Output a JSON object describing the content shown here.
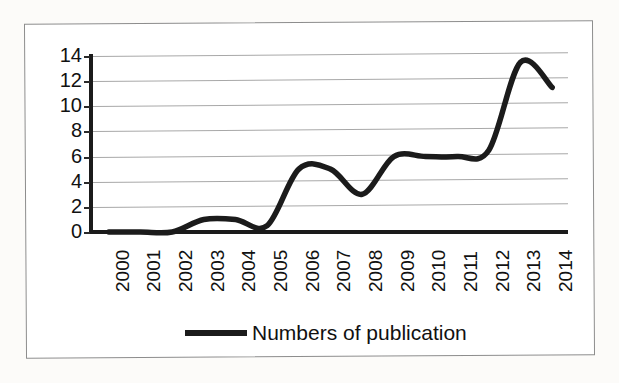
{
  "chart_data": {
    "type": "line",
    "title": "",
    "xlabel": "",
    "ylabel": "",
    "categories": [
      "2000",
      "2001",
      "2002",
      "2003",
      "2004",
      "2005",
      "2006",
      "2007",
      "2008",
      "2009",
      "2010",
      "2011",
      "2012",
      "2013",
      "2014"
    ],
    "series": [
      {
        "name": "Numbers of publication",
        "color": "#1b1b1b",
        "values": [
          0,
          0,
          0,
          1,
          1,
          0.5,
          5,
          5,
          3,
          6,
          6,
          6,
          6.5,
          13.5,
          11.5
        ]
      }
    ],
    "values": [
      0,
      0,
      0,
      1,
      1,
      0.5,
      5,
      5,
      3,
      6,
      6,
      6,
      6.5,
      13.5,
      11.5
    ],
    "ylim": [
      0,
      14
    ],
    "ytick_values": [
      14,
      12,
      10,
      8,
      6,
      4,
      2,
      0
    ],
    "ytick_labels": [
      "14",
      "12",
      "10",
      "8",
      "6",
      "4",
      "2",
      "0"
    ],
    "grid": true,
    "legend_position": "bottom-center",
    "smoothing": "spline"
  },
  "legend": {
    "entries": [
      {
        "label": "Numbers of publication",
        "color": "#1b1b1b"
      }
    ]
  },
  "artifacts": {
    "ghost_line_1": "",
    "ghost_line_2": ""
  }
}
